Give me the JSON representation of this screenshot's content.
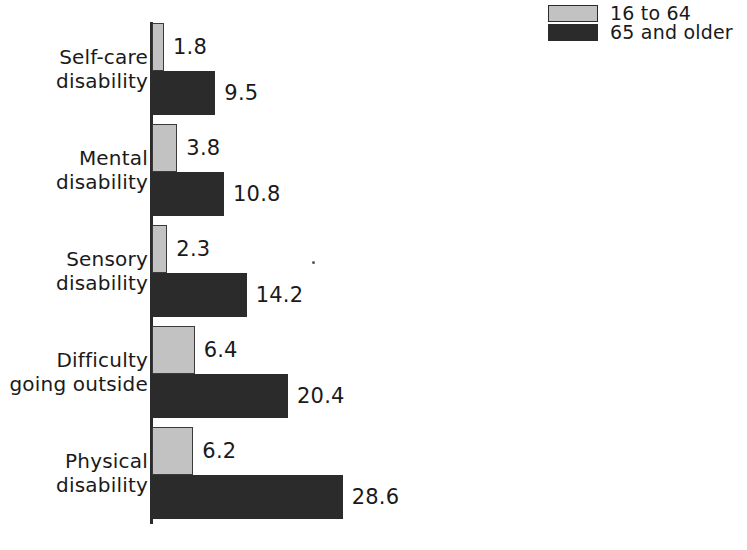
{
  "legend": {
    "position": "top-right",
    "entries": [
      {
        "label": "16 to 64",
        "swatch": "light-gray-square",
        "color": "#c2c2c2"
      },
      {
        "label": "65 and older",
        "swatch": "dark-square",
        "color": "#2b2b2b"
      }
    ]
  },
  "chart_data": {
    "type": "bar",
    "orientation": "horizontal",
    "title": "",
    "subtitle": "",
    "xlabel": "",
    "ylabel": "",
    "grid": false,
    "legend_position": "top-right",
    "axis_visible": {
      "value_axis_ticks": false,
      "category_axis_line": true
    },
    "xlim": [
      0,
      28.6
    ],
    "categories": [
      "Self-care disability",
      "Mental disability",
      "Sensory disability",
      "Difficulty going outside",
      "Physical disability"
    ],
    "category_lines": [
      [
        "Self-care",
        "disability"
      ],
      [
        "Mental",
        "disability"
      ],
      [
        "Sensory",
        "disability"
      ],
      [
        "Difficulty",
        "going outside"
      ],
      [
        "Physical",
        "disability"
      ]
    ],
    "series": [
      {
        "name": "16 to 64",
        "color": "#c2c2c2",
        "values": [
          1.8,
          3.8,
          2.3,
          6.4,
          6.2
        ],
        "labels": [
          "1.8",
          "3.8",
          "2.3",
          "6.4",
          "6.2"
        ]
      },
      {
        "name": "65 and older",
        "color": "#2b2b2b",
        "values": [
          9.5,
          10.8,
          14.2,
          20.4,
          28.6
        ],
        "labels": [
          "9.5",
          "10.8",
          "14.2",
          "20.4",
          "28.6"
        ]
      }
    ]
  },
  "render": {
    "pixels_per_unit": 6.67,
    "bar_thickness_light": 48,
    "bar_thickness_dark": 44,
    "group_pitch": 101,
    "first_group_top": 23
  }
}
